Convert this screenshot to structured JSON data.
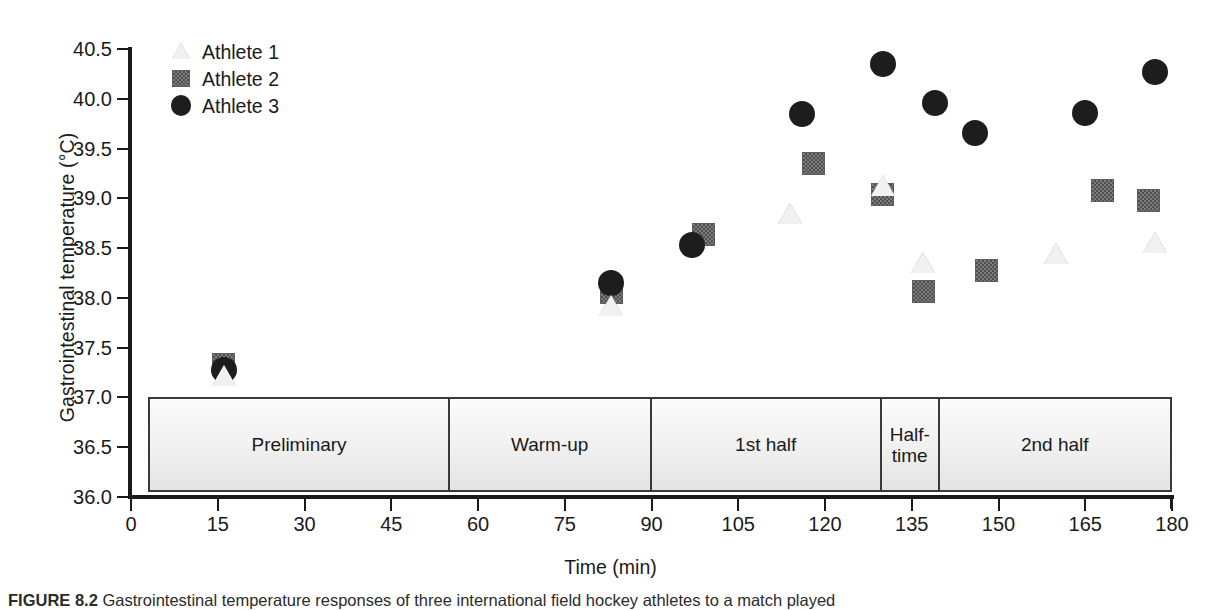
{
  "figure": {
    "caption_label": "FIGURE 8.2",
    "caption_text": "Gastrointestinal temperature responses of three international field hockey athletes to a match played"
  },
  "chart_data": {
    "type": "scatter",
    "title": "",
    "xlabel": "Time (min)",
    "ylabel": "Gastrointestinal temperature (°C)",
    "xlim": [
      0,
      180
    ],
    "ylim": [
      36.0,
      40.5
    ],
    "xticks": [
      0,
      15,
      30,
      45,
      60,
      75,
      90,
      105,
      120,
      135,
      150,
      165,
      180
    ],
    "ytick_labels": [
      "40.5",
      "40.0",
      "39.5",
      "39.0",
      "38.5",
      "38.0",
      "37.5",
      "37.0",
      "36.5",
      "36.0"
    ],
    "yticks": [
      40.5,
      40.0,
      39.5,
      39.0,
      38.5,
      38.0,
      37.5,
      37.0,
      36.5,
      36.0
    ],
    "grid": false,
    "legend_position": "top-left",
    "series": [
      {
        "name": "Athlete 1",
        "marker": "triangle-open",
        "color": "#f1f1f1",
        "points": [
          {
            "x": 16,
            "y": 37.22
          },
          {
            "x": 83,
            "y": 37.92
          },
          {
            "x": 114,
            "y": 38.85
          },
          {
            "x": 130,
            "y": 39.13
          },
          {
            "x": 137,
            "y": 38.36
          },
          {
            "x": 160,
            "y": 38.45
          },
          {
            "x": 177,
            "y": 38.56
          }
        ]
      },
      {
        "name": "Athlete 2",
        "marker": "square-filled",
        "color": "#7d7d7d",
        "points": [
          {
            "x": 16,
            "y": 37.33
          },
          {
            "x": 83,
            "y": 38.05
          },
          {
            "x": 99,
            "y": 38.64
          },
          {
            "x": 118,
            "y": 39.35
          },
          {
            "x": 130,
            "y": 39.04
          },
          {
            "x": 137,
            "y": 38.06
          },
          {
            "x": 148,
            "y": 38.28
          },
          {
            "x": 168,
            "y": 39.08
          },
          {
            "x": 176,
            "y": 38.98
          }
        ]
      },
      {
        "name": "Athlete 3",
        "marker": "circle-filled",
        "color": "#1d1d1d",
        "points": [
          {
            "x": 16,
            "y": 37.28
          },
          {
            "x": 83,
            "y": 38.15
          },
          {
            "x": 97,
            "y": 38.53
          },
          {
            "x": 116,
            "y": 39.85
          },
          {
            "x": 130,
            "y": 40.35
          },
          {
            "x": 139,
            "y": 39.96
          },
          {
            "x": 146,
            "y": 39.66
          },
          {
            "x": 165,
            "y": 39.86
          },
          {
            "x": 177,
            "y": 40.27
          }
        ]
      }
    ],
    "phases": [
      {
        "label": "Preliminary",
        "start": 3,
        "end": 55
      },
      {
        "label": "Warm-up",
        "start": 55,
        "end": 90
      },
      {
        "label": "1st half",
        "start": 90,
        "end": 130
      },
      {
        "label": "Half-\ntime",
        "start": 130,
        "end": 140
      },
      {
        "label": "2nd half",
        "start": 140,
        "end": 180
      }
    ]
  }
}
